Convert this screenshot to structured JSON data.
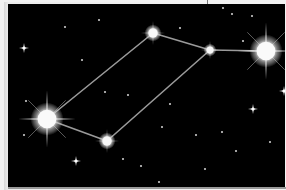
{
  "scene": {
    "subject": "constellation star chart",
    "background_color": "#000000",
    "line_color": "#9a9a9a",
    "star_color": "#ffffff",
    "stars": [
      {
        "id": "a",
        "magnitude": "bright"
      },
      {
        "id": "b",
        "magnitude": "medium"
      },
      {
        "id": "c",
        "magnitude": "medium"
      },
      {
        "id": "d",
        "magnitude": "small"
      },
      {
        "id": "e",
        "magnitude": "bright"
      }
    ],
    "connections": [
      [
        "a",
        "c"
      ],
      [
        "a",
        "b"
      ],
      [
        "b",
        "d"
      ],
      [
        "c",
        "d"
      ],
      [
        "d",
        "e"
      ]
    ],
    "background_sparkle_count": 4,
    "background_dot_count": 22
  }
}
